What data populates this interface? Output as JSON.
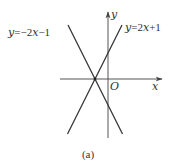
{
  "figure": {
    "caption": "(a)",
    "axes": {
      "x_label": "x",
      "y_label": "y",
      "origin_label": "O"
    },
    "lines": [
      {
        "label": "y=−2x−1",
        "label_parts": {
          "lhs": "y",
          "eq": "=",
          "rhs_prefix": "−2",
          "var": "x",
          "rhs_suffix": "−1"
        },
        "slope": -2,
        "intercept": -1
      },
      {
        "label": "y=2x+1",
        "label_parts": {
          "lhs": "y",
          "eq": "=",
          "rhs_prefix": "2",
          "var": "x",
          "rhs_suffix": "+1"
        },
        "slope": 2,
        "intercept": 1
      }
    ],
    "intersection": {
      "x": -0.5,
      "y": 0
    },
    "colors": {
      "line": "#333333",
      "axis": "#555555",
      "background": "#ffffff"
    }
  }
}
